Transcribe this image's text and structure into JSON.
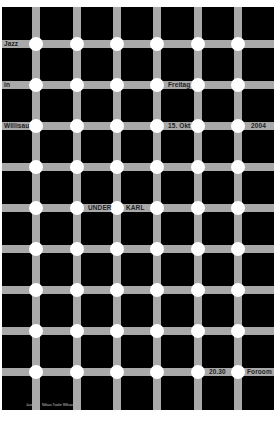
{
  "poster": {
    "background": "#000000",
    "bar_color": "#a9a9a9",
    "dot_color": "#ffffff",
    "grid": {
      "columns_x": [
        34,
        75,
        115,
        155,
        196,
        236
      ],
      "rows_y": [
        37,
        78,
        119,
        160,
        201,
        242,
        283,
        324,
        365
      ]
    },
    "labels": {
      "jazz": "Jazz",
      "in": "in",
      "willisau": "Willisau",
      "freitag": "Freitag",
      "date": "15. Okt",
      "year": "2004",
      "under": "UNDER",
      "karl": "KARL",
      "time": "20.30",
      "venue": "Foroom"
    },
    "credits": {
      "left": "Jazz",
      "right": "Niklaus Troxler Willisau"
    }
  }
}
